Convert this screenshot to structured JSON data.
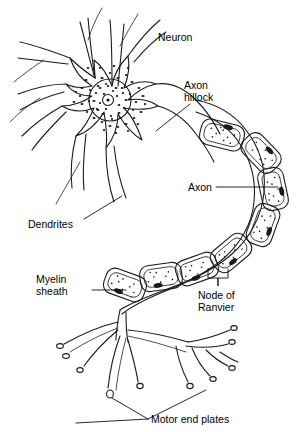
{
  "figure": {
    "background_color": "#ffffff",
    "ink_color": "#1a1a1a",
    "width": 296,
    "height": 432,
    "style": "black-and-white line drawing"
  },
  "labels": {
    "neuron": "Neuron",
    "axon_hillock_line1": "Axon",
    "axon_hillock_line2": "hillock",
    "axon": "Axon",
    "dendrites": "Dendrites",
    "myelin_line1": "Myelin",
    "myelin_line2": "sheath",
    "node_line1": "Node of",
    "node_line2": "Ranvier",
    "motor_end_plates": "Motor end plates"
  },
  "parts": [
    {
      "name": "soma",
      "label": "Neuron",
      "description": "cell body with stippled cytoplasm"
    },
    {
      "name": "nucleus",
      "label": "",
      "description": "round nucleus with nucleolus"
    },
    {
      "name": "dendrites",
      "label": "Dendrites",
      "description": "branching tapered processes"
    },
    {
      "name": "axon-hillock",
      "label": "Axon hillock",
      "description": "cone where axon leaves soma"
    },
    {
      "name": "axon",
      "label": "Axon",
      "description": "long fiber curving right and down"
    },
    {
      "name": "myelin-sheath",
      "label": "Myelin sheath",
      "description": "chain of stippled Schwann cell segments"
    },
    {
      "name": "node-of-ranvier",
      "label": "Node of Ranvier",
      "description": "gap between myelin segments"
    },
    {
      "name": "motor-end-plates",
      "label": "Motor end plates",
      "description": "terminal boutons on muscle"
    }
  ]
}
